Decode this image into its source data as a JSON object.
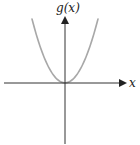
{
  "figure": {
    "y_axis_label": "g(x)",
    "x_axis_label": "x",
    "curve": "parabola",
    "function": "g(x) = x^2"
  },
  "colors": {
    "axis": "#333333",
    "curve": "#a8a8a8",
    "label": "#222222"
  }
}
